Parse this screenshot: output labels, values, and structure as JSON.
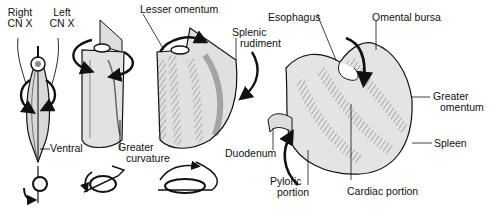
{
  "figure": {
    "labels": {
      "right_cn_x_1": "Right",
      "right_cn_x_2": "CN X",
      "left_cn_x_1": "Left",
      "left_cn_x_2": "CN X",
      "ventral": "Ventral",
      "greater_curvature_1": "Greater",
      "greater_curvature_2": "curvature",
      "lesser_omentum": "Lesser omentum",
      "splenic_rudiment_1": "Splenic",
      "splenic_rudiment_2": "rudiment",
      "esophagus": "Esophagus",
      "omental_bursa": "Omental bursa",
      "greater_omentum_1": "Greater",
      "greater_omentum_2": "omentum",
      "spleen": "Spleen",
      "duodenum": "Duodenum",
      "pyloric_portion_1": "Pyloric",
      "pyloric_portion_2": "portion",
      "cardiac_portion": "Cardiac portion"
    },
    "colors": {
      "ink": "#111111",
      "fill": "#e6e6e6",
      "shade": "#9a9a9a",
      "background": "#ffffff"
    }
  }
}
